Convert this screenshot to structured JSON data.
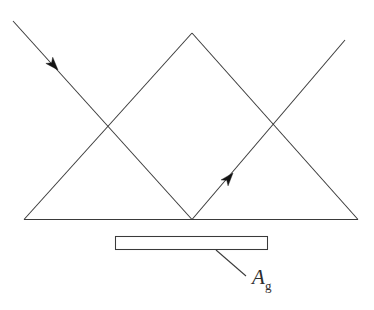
{
  "figure": {
    "type": "optical-ray-diagram",
    "width": 374,
    "height": 310,
    "background_color": "#ffffff",
    "line_color": "#3a3a3a",
    "arrow_color": "#141414",
    "text_color": "#2e2e2e"
  },
  "labels": {
    "plate": {
      "symbol": "A",
      "subscript": "g",
      "full_text": "Ag",
      "x": 252,
      "y": 284
    }
  },
  "geometry": {
    "base_line": {
      "x1": 24,
      "y1": 219.5,
      "x2": 358,
      "y2": 219.5
    },
    "triangle_left_edge": {
      "x1": 24,
      "y1": 219.5,
      "x2": 192,
      "y2": 33
    },
    "triangle_right_edge": {
      "x1": 192,
      "y1": 33,
      "x2": 358,
      "y2": 219.5
    },
    "incident_ray": {
      "x1": 13,
      "y1": 21,
      "x2": 192,
      "y2": 219.5
    },
    "reflected_ray": {
      "x1": 192,
      "y1": 219.5,
      "x2": 345,
      "y2": 40
    },
    "leader_line": {
      "x1": 216,
      "y1": 250,
      "x2": 246,
      "y2": 276
    },
    "plate_rect": {
      "x": 115,
      "y": 236,
      "width": 153,
      "height": 14
    },
    "crossing_left": {
      "x": 108,
      "y": 128
    },
    "crossing_right": {
      "x": 275,
      "y": 128
    },
    "vertex_bottom": {
      "x": 192,
      "y": 219.5
    },
    "apex_top": {
      "x": 192,
      "y": 33
    },
    "arrow_incident": {
      "x": 58,
      "y": 70,
      "angle_deg": 48
    },
    "arrow_reflected": {
      "x": 233,
      "y": 173,
      "angle_deg": -49.5
    }
  }
}
